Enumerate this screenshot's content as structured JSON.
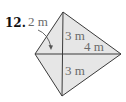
{
  "problem": {
    "number": "12."
  },
  "figure": {
    "shape": "kite",
    "vertices": {
      "top": [
        63,
        12
      ],
      "left": [
        35,
        54
      ],
      "right": [
        121,
        54
      ],
      "bottom": [
        62,
        96
      ]
    },
    "center": [
      63,
      54
    ],
    "labels": {
      "left_half_diagonal": "2 m",
      "upper_vertical": "3 m",
      "right_half_diagonal": "4 m",
      "lower_vertical": "3 m"
    },
    "colors": {
      "fill": "#e6e6e6",
      "stroke": "#3a3a3a",
      "label": "#6a6a6a",
      "number": "#111111"
    }
  }
}
